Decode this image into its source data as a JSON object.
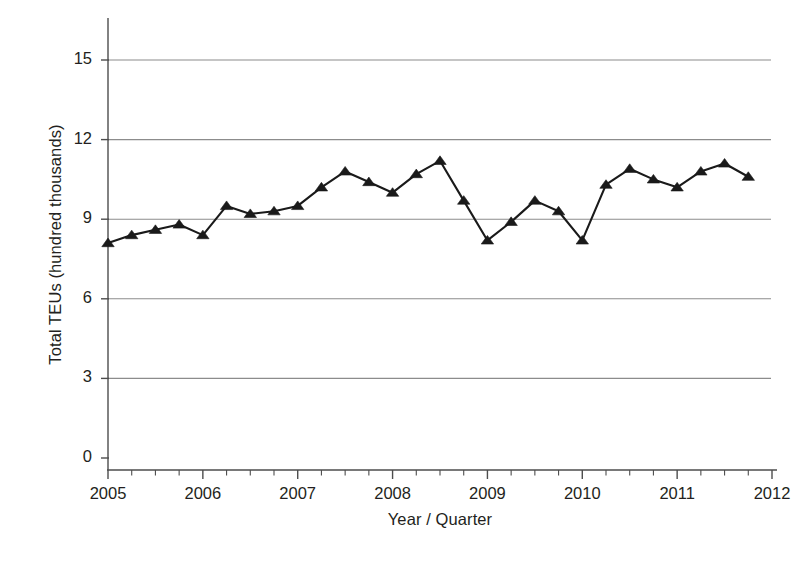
{
  "chart_data": {
    "type": "line",
    "title": "",
    "subtitle": "",
    "xlabel": "Year / Quarter",
    "ylabel": "Total TEUs (hundred thousands)",
    "xlim": [
      2005,
      2012
    ],
    "ylim": [
      0,
      15
    ],
    "grid": true,
    "legend": "none",
    "marker": "triangle",
    "line_color": "#1a1a1a",
    "marker_color": "#1a1a1a",
    "grid_color": "#8c8c8c",
    "axis_color": "#4d4d4d",
    "y_ticks": [
      "0",
      "3",
      "6",
      "9",
      "12",
      "15"
    ],
    "y_tick_values": [
      0,
      3,
      6,
      9,
      12,
      15
    ],
    "x_ticks": [
      "2005",
      "2006",
      "2007",
      "2008",
      "2009",
      "2010",
      "2011",
      "2012"
    ],
    "x_tick_values": [
      2005,
      2006,
      2007,
      2008,
      2009,
      2010,
      2011,
      2012
    ],
    "x_minor_ticks_per_year": 4,
    "x": [
      2005.0,
      2005.25,
      2005.5,
      2005.75,
      2006.0,
      2006.25,
      2006.5,
      2006.75,
      2007.0,
      2007.25,
      2007.5,
      2007.75,
      2008.0,
      2008.25,
      2008.5,
      2008.75,
      2009.0,
      2009.25,
      2009.5,
      2009.75,
      2010.0,
      2010.25,
      2010.5,
      2010.75,
      2011.0,
      2011.25,
      2011.5,
      2011.75
    ],
    "categories": [
      "2005 Q1",
      "2005 Q2",
      "2005 Q3",
      "2005 Q4",
      "2006 Q1",
      "2006 Q2",
      "2006 Q3",
      "2006 Q4",
      "2007 Q1",
      "2007 Q2",
      "2007 Q3",
      "2007 Q4",
      "2008 Q1",
      "2008 Q2",
      "2008 Q3",
      "2008 Q4",
      "2009 Q1",
      "2009 Q2",
      "2009 Q3",
      "2009 Q4",
      "2010 Q1",
      "2010 Q2",
      "2010 Q3",
      "2010 Q4",
      "2011 Q1",
      "2011 Q2",
      "2011 Q3",
      "2011 Q4"
    ],
    "values": [
      8.1,
      8.4,
      8.6,
      8.8,
      8.4,
      9.5,
      9.2,
      9.3,
      9.5,
      10.2,
      10.8,
      10.4,
      10.0,
      10.7,
      11.2,
      9.7,
      8.2,
      8.9,
      9.7,
      9.3,
      8.2,
      10.3,
      10.9,
      10.5,
      10.2,
      10.8,
      11.1,
      10.6
    ],
    "series": [
      {
        "name": "Total TEUs",
        "values": [
          8.1,
          8.4,
          8.6,
          8.8,
          8.4,
          9.5,
          9.2,
          9.3,
          9.5,
          10.2,
          10.8,
          10.4,
          10.0,
          10.7,
          11.2,
          9.7,
          8.2,
          8.9,
          9.7,
          9.3,
          8.2,
          10.3,
          10.9,
          10.5,
          10.2,
          10.8,
          11.1,
          10.6
        ]
      }
    ]
  },
  "axes": {
    "y_title": "Total TEUs (hundred thousands)",
    "x_title": "Year / Quarter"
  },
  "page": {
    "footer_artifact": ""
  }
}
